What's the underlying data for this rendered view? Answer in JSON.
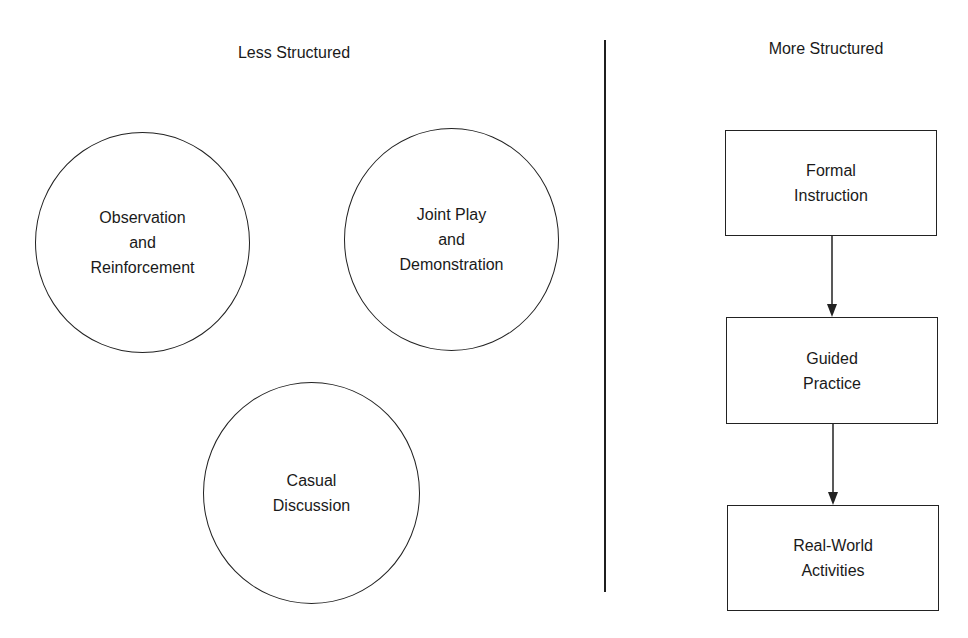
{
  "left_panel": {
    "heading": "Less Structured",
    "nodes": [
      {
        "id": "observation",
        "shape": "circle",
        "lines": [
          "Observation",
          "and",
          "Reinforcement"
        ]
      },
      {
        "id": "joint-play",
        "shape": "circle",
        "lines": [
          "Joint Play",
          "and",
          "Demonstration"
        ]
      },
      {
        "id": "casual-discussion",
        "shape": "circle",
        "lines": [
          "Casual",
          "Discussion"
        ]
      }
    ]
  },
  "right_panel": {
    "heading": "More Structured",
    "nodes": [
      {
        "id": "formal-instruction",
        "shape": "box",
        "lines": [
          "Formal",
          "Instruction"
        ]
      },
      {
        "id": "guided-practice",
        "shape": "box",
        "lines": [
          "Guided",
          "Practice"
        ]
      },
      {
        "id": "real-world-activities",
        "shape": "box",
        "lines": [
          "Real-World",
          "Activities"
        ]
      }
    ],
    "edges": [
      {
        "from": "formal-instruction",
        "to": "guided-practice"
      },
      {
        "from": "guided-practice",
        "to": "real-world-activities"
      }
    ]
  },
  "colors": {
    "stroke": "#222222",
    "background": "#ffffff"
  }
}
